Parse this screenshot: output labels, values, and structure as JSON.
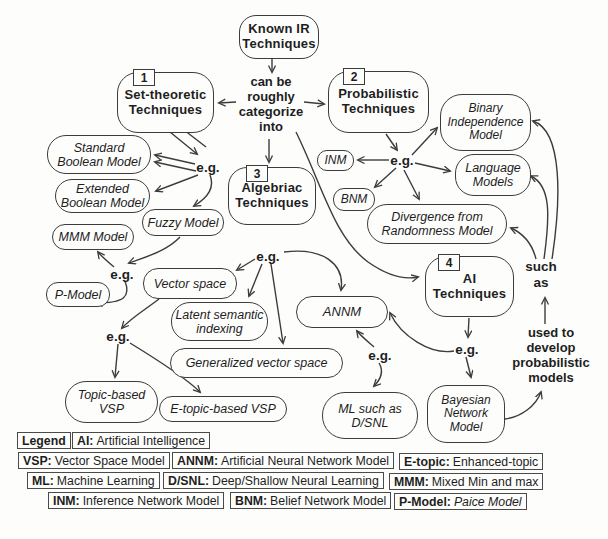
{
  "diagram": {
    "eg": "e.g.",
    "root": "Known IR\nTechniques",
    "connector": "can be\nroughly\ncategorize\ninto",
    "such_as": "such\nas",
    "used_to": "used to\ndevelop\nprobabilistic\nmodels",
    "categories": {
      "set": {
        "num": "1",
        "label": "Set-theoretic\nTechniques"
      },
      "prob": {
        "num": "2",
        "label": "Probabilistic\nTechniques"
      },
      "alg": {
        "num": "3",
        "label": "Algebriac\nTechniques"
      },
      "ai": {
        "num": "4",
        "label": "AI\nTechniques"
      }
    },
    "models": {
      "standard": "Standard\nBoolean Model",
      "extended": "Extended\nBoolean Model",
      "fuzzy": "Fuzzy Model",
      "mmm": "MMM Model",
      "pmodel": "P-Model",
      "vector": "Vector space",
      "latent": "Latent semantic\nindexing",
      "generalized": "Generalized vector space",
      "topic": "Topic-based\nVSP",
      "etopic": "E-topic-based VSP",
      "inm": "INM",
      "bnm": "BNM",
      "binary": "Binary\nIndependence\nModel",
      "language": "Language\nModels",
      "divergence": "Divergence from\nRandomness Model",
      "annm": "ANNM",
      "ml": "ML such as\nD/SNL",
      "bayesian": "Bayesian\nNetwork\nModel"
    },
    "legend": {
      "title": "Legend",
      "entries": [
        {
          "key": "AI:",
          "value": "Artificial Intelligence"
        },
        {
          "key": "VSP:",
          "value": "Vector Space Model"
        },
        {
          "key": "ANNM:",
          "value": "Artificial Neural Network Model"
        },
        {
          "key": "E-topic:",
          "value": "Enhanced-topic"
        },
        {
          "key": "ML:",
          "value": "Machine Learning"
        },
        {
          "key": "D/SNL:",
          "value": "Deep/Shallow Neural Learning"
        },
        {
          "key": "MMM:",
          "value": "Mixed Min and max"
        },
        {
          "key": "INM:",
          "value": "Inference Network Model"
        },
        {
          "key": "BNM:",
          "value": "Belief Network Model"
        },
        {
          "key": "P-Model:",
          "value": "Paice Model"
        }
      ]
    },
    "colors": {
      "stroke": "#3c3c3c",
      "background": "#fdfdfc",
      "text": "#1e1e1e"
    }
  }
}
